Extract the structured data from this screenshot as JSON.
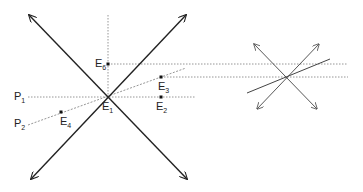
{
  "diagram": {
    "main": {
      "center_label": "E1",
      "points": [
        {
          "id": "E1",
          "base": "E",
          "sub": "1",
          "x": 108,
          "y": 97,
          "lx": 102,
          "ly": 102
        },
        {
          "id": "E2",
          "base": "E",
          "sub": "2",
          "x": 161,
          "y": 97,
          "lx": 156,
          "ly": 102
        },
        {
          "id": "E3",
          "base": "E",
          "sub": "3",
          "x": 161,
          "y": 77,
          "lx": 158,
          "ly": 82
        },
        {
          "id": "E4",
          "base": "E",
          "sub": "4",
          "x": 61,
          "y": 112,
          "lx": 60,
          "ly": 117
        },
        {
          "id": "E6",
          "base": "E",
          "sub": "6",
          "x": 108,
          "y": 64,
          "lx": 96,
          "ly": 58
        }
      ],
      "lines": [
        {
          "id": "P1",
          "base": "P",
          "sub": "1",
          "lx": 14,
          "ly": 91
        },
        {
          "id": "P2",
          "base": "P",
          "sub": "2",
          "lx": 14,
          "ly": 118
        }
      ]
    },
    "colors": {
      "stroke": "#222222",
      "dotted": "#888888"
    }
  }
}
